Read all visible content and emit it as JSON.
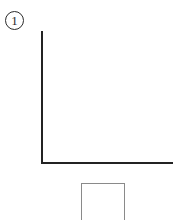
{
  "figure": {
    "background_color": "#ffffff",
    "width": 180,
    "height": 220,
    "panel_label": {
      "text": "1",
      "style": "circled-numeral",
      "color": "#2b2b2b"
    },
    "axes": {
      "name": "empty-cartesian-axes",
      "shape": "L",
      "line_color": "#232323",
      "line_width_px": 2,
      "y_axis": {
        "label": "",
        "ticks": [],
        "tick_labels": []
      },
      "x_axis": {
        "label": "",
        "ticks": [],
        "tick_labels": []
      },
      "gridlines": false,
      "data_series": []
    },
    "lower_box": {
      "name": "caption-box",
      "text": "",
      "border_color": "#8a8a8a",
      "fill_color": "#ffffff",
      "clipped_at_bottom": true
    }
  }
}
